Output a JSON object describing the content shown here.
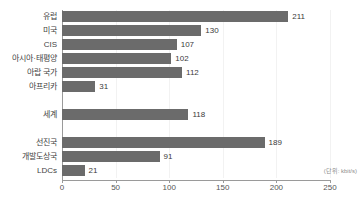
{
  "title": "",
  "unit_note": "(단위: kbit/s)",
  "chart_data": {
    "type": "bar",
    "orientation": "horizontal",
    "title": "",
    "xlabel": "",
    "ylabel": "",
    "xlim": [
      0,
      250
    ],
    "ticks": [
      "0",
      "50",
      "100",
      "150",
      "200",
      "250"
    ],
    "tick_values": [
      0,
      50,
      100,
      150,
      200,
      250
    ],
    "grid": true,
    "legend": "none",
    "unit": "kbit/s",
    "bar_color": "#6b6b6b",
    "categories": [
      "유럽",
      "미국",
      "CIS",
      "아시아·태평양",
      "아랍 국가",
      "아프리카",
      "세계",
      "선진국",
      "개발도상국",
      "LDCs"
    ],
    "values": [
      211,
      130,
      107,
      102,
      112,
      31,
      118,
      189,
      91,
      21
    ],
    "groups": [
      {
        "name": "지역",
        "categories": [
          "유럽",
          "미국",
          "CIS",
          "아시아·태평양",
          "아랍 국가",
          "아프리카"
        ],
        "values": [
          211,
          130,
          107,
          102,
          112,
          31
        ]
      },
      {
        "name": "세계",
        "categories": [
          "세계"
        ],
        "values": [
          118
        ]
      },
      {
        "name": "발전단계",
        "categories": [
          "선진국",
          "개발도상국",
          "LDCs"
        ],
        "values": [
          189,
          91,
          21
        ]
      }
    ],
    "rows": [
      {
        "label": "유럽",
        "value": 211,
        "slot": 0
      },
      {
        "label": "미국",
        "value": 130,
        "slot": 1
      },
      {
        "label": "CIS",
        "value": 107,
        "slot": 2
      },
      {
        "label": "아시아·태평양",
        "value": 102,
        "slot": 3
      },
      {
        "label": "아랍 국가",
        "value": 112,
        "slot": 4
      },
      {
        "label": "아프리카",
        "value": 31,
        "slot": 5
      },
      {
        "label": "세계",
        "value": 118,
        "slot": 7
      },
      {
        "label": "선진국",
        "value": 189,
        "slot": 9
      },
      {
        "label": "개발도상국",
        "value": 91,
        "slot": 10
      },
      {
        "label": "LDCs",
        "value": 21,
        "slot": 11
      }
    ]
  }
}
